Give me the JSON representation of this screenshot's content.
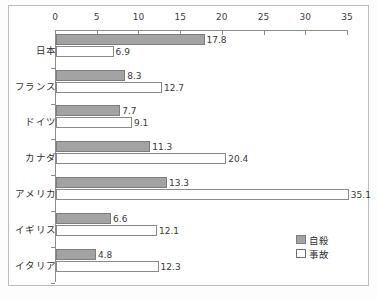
{
  "chart_data": {
    "type": "bar",
    "orientation": "horizontal",
    "title": "",
    "xlabel": "",
    "ylabel": "",
    "xlim": [
      0,
      35
    ],
    "xticks": [
      0,
      5,
      10,
      15,
      20,
      25,
      30,
      35
    ],
    "grid": false,
    "axis_position": "top",
    "legend_position": "bottom-right",
    "categories": [
      "日本",
      "フランス",
      "ドイツ",
      "カナダ",
      "アメリカ",
      "イギリス",
      "イタリア"
    ],
    "series": [
      {
        "name": "自殺",
        "color": "#a3a3a3",
        "values": [
          17.8,
          8.3,
          7.7,
          11.3,
          13.3,
          6.6,
          4.8
        ],
        "labels": [
          "17.8",
          "8.3",
          "7.7",
          "11.3",
          "13.3",
          "6.6",
          "4.8"
        ]
      },
      {
        "name": "事故",
        "color": "#ffffff",
        "values": [
          6.9,
          12.7,
          9.1,
          20.4,
          35.1,
          12.1,
          12.3
        ],
        "labels": [
          "6.9",
          "12.7",
          "9.1",
          "20.4",
          "35.1",
          "12.1",
          "12.3"
        ]
      }
    ]
  },
  "axis": {
    "tick_labels": [
      "0",
      "5",
      "10",
      "15",
      "20",
      "25",
      "30",
      "35"
    ]
  },
  "legend": {
    "entries": [
      {
        "label": "自殺"
      },
      {
        "label": "事故"
      }
    ]
  },
  "caption": {
    "sliver_text": ""
  }
}
